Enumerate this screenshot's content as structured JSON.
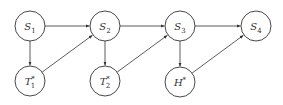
{
  "diagram": {
    "type": "directed-graph",
    "nodes": [
      {
        "id": "S1",
        "base": "S",
        "sub": "1",
        "sup": "",
        "x": 30,
        "y": 26
      },
      {
        "id": "S2",
        "base": "S",
        "sub": "2",
        "sup": "",
        "x": 105,
        "y": 26
      },
      {
        "id": "S3",
        "base": "S",
        "sub": "3",
        "sup": "",
        "x": 180,
        "y": 26
      },
      {
        "id": "S4",
        "base": "S",
        "sub": "4",
        "sup": "",
        "x": 256,
        "y": 26
      },
      {
        "id": "T1*",
        "base": "T",
        "sub": "1",
        "sup": "*",
        "x": 30,
        "y": 81
      },
      {
        "id": "T2*",
        "base": "T",
        "sub": "2",
        "sup": "*",
        "x": 105,
        "y": 81
      },
      {
        "id": "H*",
        "base": "H",
        "sub": "",
        "sup": "*",
        "x": 180,
        "y": 82
      }
    ],
    "edges": [
      {
        "from": "S1",
        "to": "S2"
      },
      {
        "from": "S2",
        "to": "S3"
      },
      {
        "from": "S3",
        "to": "S4"
      },
      {
        "from": "S1",
        "to": "T1*"
      },
      {
        "from": "T1*",
        "to": "S2"
      },
      {
        "from": "S2",
        "to": "T2*"
      },
      {
        "from": "T2*",
        "to": "S3"
      },
      {
        "from": "S3",
        "to": "H*"
      },
      {
        "from": "H*",
        "to": "S4"
      }
    ],
    "node_radius": 15,
    "stroke_color": "#333333"
  }
}
